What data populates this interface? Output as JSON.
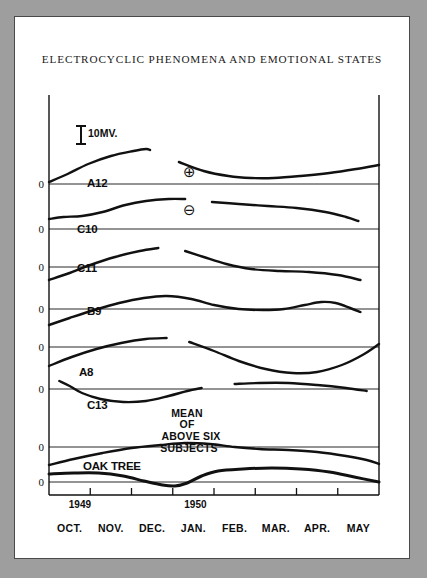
{
  "figure": {
    "title": "ELECTROCYCLIC PHENOMENA AND EMOTIONAL STATES",
    "scale_bar_label": "10MV.",
    "zero_label": "0",
    "positive_symbol": "⊕",
    "negative_symbol": "⊖",
    "mean_note_lines": [
      "MEAN",
      "OF",
      "ABOVE SIX",
      "SUBJECTS"
    ],
    "years": [
      "1949",
      "1950"
    ],
    "ink_color": "#111111",
    "paper_color": "#ffffff",
    "surround_color": "#9e9e9e"
  },
  "chart_data": {
    "type": "line",
    "title": "ELECTROCYCLIC PHENOMENA AND EMOTIONAL STATES",
    "xlabel": "",
    "ylabel": "",
    "grid": false,
    "legend": "none",
    "x_tick_labels": [
      "OCT.",
      "NOV.",
      "DEC.",
      "JAN.",
      "FEB.",
      "MAR.",
      "APR.",
      "MAY"
    ],
    "x_range": [
      0,
      8
    ],
    "y_unit": "MV",
    "scale_bar_mv": 10,
    "annotations": [
      {
        "text": "⊕",
        "meaning": "positive polarity",
        "x": 2.95,
        "y_panel": "A12"
      },
      {
        "text": "⊖",
        "meaning": "negative polarity",
        "x": 2.95,
        "y_panel": "C10"
      },
      {
        "text": "MEAN OF ABOVE SIX SUBJECTS",
        "x": 3.4,
        "y_panel": "MEAN"
      },
      {
        "text": "1949",
        "x": 0.75,
        "y_panel": "axis"
      },
      {
        "text": "1950",
        "x": 3.55,
        "y_panel": "axis"
      }
    ],
    "series": [
      {
        "name": "A12",
        "label": "A12",
        "baseline_y": 167,
        "points": [
          [
            0.0,
            2
          ],
          [
            0.45,
            10
          ],
          [
            0.95,
            20
          ],
          [
            1.5,
            28
          ],
          [
            2.05,
            33
          ],
          [
            2.35,
            35
          ],
          [
            2.45,
            34
          ],
          [
            3.15,
            22
          ],
          [
            3.75,
            13
          ],
          [
            4.35,
            8
          ],
          [
            4.9,
            6
          ],
          [
            5.45,
            6
          ],
          [
            6.1,
            8
          ],
          [
            6.8,
            11
          ],
          [
            7.45,
            15
          ],
          [
            8.0,
            19
          ]
        ],
        "breaks": [
          2.45
        ]
      },
      {
        "name": "C10",
        "label": "C10",
        "baseline_y": 212,
        "points": [
          [
            0.0,
            10
          ],
          [
            0.35,
            12
          ],
          [
            0.8,
            13
          ],
          [
            1.3,
            17
          ],
          [
            1.85,
            24
          ],
          [
            2.35,
            28
          ],
          [
            2.9,
            30
          ],
          [
            3.3,
            30
          ],
          [
            3.95,
            27
          ],
          [
            4.6,
            25
          ],
          [
            5.3,
            23
          ],
          [
            6.0,
            21
          ],
          [
            6.7,
            17
          ],
          [
            7.2,
            12
          ],
          [
            7.5,
            8
          ]
        ],
        "breaks": [
          3.3
        ]
      },
      {
        "name": "C11",
        "label": "C11",
        "baseline_y": 250,
        "points": [
          [
            0.0,
            -13
          ],
          [
            0.5,
            -6
          ],
          [
            1.0,
            2
          ],
          [
            1.6,
            10
          ],
          [
            2.2,
            16
          ],
          [
            2.65,
            19
          ],
          [
            3.3,
            16
          ],
          [
            3.75,
            10
          ],
          [
            4.3,
            3
          ],
          [
            4.9,
            -2
          ],
          [
            5.6,
            -4
          ],
          [
            6.3,
            -5
          ],
          [
            7.0,
            -8
          ],
          [
            7.55,
            -13
          ]
        ],
        "breaks": [
          2.65
        ]
      },
      {
        "name": "B9",
        "label": "B9",
        "baseline_y": 292,
        "points": [
          [
            0.0,
            -16
          ],
          [
            0.5,
            -9
          ],
          [
            1.1,
            -1
          ],
          [
            1.7,
            6
          ],
          [
            2.3,
            11
          ],
          [
            2.85,
            13
          ],
          [
            3.45,
            10
          ],
          [
            4.0,
            4
          ],
          [
            4.6,
            0
          ],
          [
            5.2,
            -1
          ],
          [
            5.7,
            0
          ],
          [
            6.2,
            4
          ],
          [
            6.6,
            7
          ],
          [
            6.95,
            6
          ],
          [
            7.3,
            1
          ],
          [
            7.55,
            -3
          ]
        ],
        "breaks": []
      },
      {
        "name": "A8",
        "label": "A8",
        "baseline_y": 330,
        "points": [
          [
            0.0,
            -19
          ],
          [
            0.55,
            -10
          ],
          [
            1.15,
            -2
          ],
          [
            1.75,
            4
          ],
          [
            2.35,
            8
          ],
          [
            2.85,
            9
          ],
          [
            3.4,
            5
          ],
          [
            4.0,
            -4
          ],
          [
            4.6,
            -14
          ],
          [
            5.25,
            -22
          ],
          [
            5.9,
            -26
          ],
          [
            6.5,
            -25
          ],
          [
            7.1,
            -18
          ],
          [
            7.6,
            -8
          ],
          [
            8.0,
            3
          ]
        ],
        "breaks": [
          2.85
        ]
      },
      {
        "name": "C13",
        "label": "C13",
        "baseline_y": 372,
        "points": [
          [
            0.25,
            8
          ],
          [
            0.5,
            3
          ],
          [
            0.8,
            -4
          ],
          [
            1.25,
            -10
          ],
          [
            1.8,
            -13
          ],
          [
            2.35,
            -12
          ],
          [
            2.9,
            -7
          ],
          [
            3.35,
            -2
          ],
          [
            3.7,
            1
          ],
          [
            4.5,
            5
          ],
          [
            5.1,
            6
          ],
          [
            5.8,
            6
          ],
          [
            6.5,
            4
          ],
          [
            7.2,
            1
          ],
          [
            7.7,
            -2
          ]
        ],
        "breaks": [
          3.7
        ]
      },
      {
        "name": "MEAN",
        "label": "",
        "baseline_y": 430,
        "points": [
          [
            0.0,
            -18
          ],
          [
            0.6,
            -12
          ],
          [
            1.3,
            -6
          ],
          [
            2.0,
            -1
          ],
          [
            2.7,
            2
          ],
          [
            3.3,
            4
          ],
          [
            3.9,
            3
          ],
          [
            4.5,
            0
          ],
          [
            5.1,
            -2
          ],
          [
            5.8,
            -3
          ],
          [
            6.5,
            -5
          ],
          [
            7.2,
            -9
          ],
          [
            7.7,
            -13
          ],
          [
            8.0,
            -17
          ]
        ],
        "breaks": []
      },
      {
        "name": "OAK TREE",
        "label": "OAK TREE",
        "baseline_y": 465,
        "points": [
          [
            0.0,
            8
          ],
          [
            0.6,
            9
          ],
          [
            1.2,
            9
          ],
          [
            1.8,
            6
          ],
          [
            2.3,
            1
          ],
          [
            2.75,
            -3
          ],
          [
            3.05,
            -4
          ],
          [
            3.35,
            -1
          ],
          [
            3.7,
            6
          ],
          [
            4.1,
            11
          ],
          [
            4.7,
            13
          ],
          [
            5.4,
            14
          ],
          [
            6.1,
            13
          ],
          [
            6.8,
            10
          ],
          [
            7.4,
            5
          ],
          [
            8.0,
            0
          ]
        ],
        "breaks": []
      }
    ]
  },
  "axis": {
    "tick_positions": [
      1,
      2,
      3,
      4,
      5,
      6,
      7
    ],
    "month_label_positions": [
      0.5,
      1.5,
      2.5,
      3.5,
      4.5,
      5.5,
      6.5,
      7.5
    ]
  }
}
